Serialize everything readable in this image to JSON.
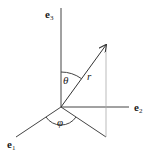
{
  "diagram": {
    "axes": [
      {
        "id": "e1",
        "label": "e",
        "subscript": "1"
      },
      {
        "id": "e2",
        "label": "e",
        "subscript": "2"
      },
      {
        "id": "e3",
        "label": "e",
        "subscript": "3"
      }
    ],
    "vector_label": "r",
    "polar_angle_label": "θ",
    "azimuth_angle_label": "φ",
    "colors": {
      "line": "#333333",
      "projection": "#999999",
      "background": "#ffffff"
    }
  }
}
